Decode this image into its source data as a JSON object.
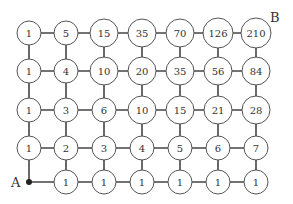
{
  "diagram": {
    "start_label": "A",
    "end_label": "B",
    "columns": 7,
    "rows": 5,
    "grid": [
      [
        "1",
        "5",
        "15",
        "35",
        "70",
        "126",
        "210"
      ],
      [
        "1",
        "4",
        "10",
        "20",
        "35",
        "56",
        "84"
      ],
      [
        "1",
        "3",
        "6",
        "10",
        "15",
        "21",
        "28"
      ],
      [
        "1",
        "2",
        "3",
        "4",
        "5",
        "6",
        "7"
      ],
      [
        "",
        "1",
        "1",
        "1",
        "1",
        "1",
        "1"
      ]
    ],
    "col_x": [
      29,
      66,
      104,
      142,
      180,
      218,
      256
    ],
    "row_y": [
      33,
      71,
      110,
      148,
      182
    ],
    "colors": {
      "line": "#444444",
      "circle_stroke": "#555555",
      "text": "#333333"
    }
  }
}
